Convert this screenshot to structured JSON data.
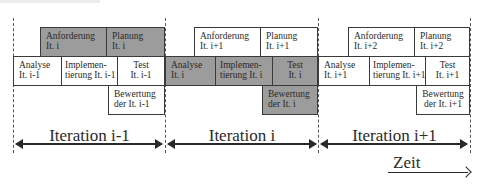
{
  "diagram": {
    "iterations": [
      {
        "label": "Iteration i-1",
        "anforderung": {
          "l1": "Anforderung",
          "l2": "It. i",
          "shaded": true
        },
        "planung": {
          "l1": "Planung",
          "l2": "It. i",
          "shaded": true
        },
        "analyse": {
          "l1": "Analyse",
          "l2": "It. i-1",
          "shaded": false
        },
        "implementierung": {
          "l1": "Implemen-",
          "l2": "tierung It. i-1",
          "shaded": false
        },
        "test": {
          "l1": "Test",
          "l2": "It. i-1",
          "shaded": false
        },
        "bewertung": {
          "l1": "Bewertung",
          "l2": "der It. i-1",
          "shaded": false
        }
      },
      {
        "label": "Iteration i",
        "anforderung": {
          "l1": "Anforderung",
          "l2": "It. i+1",
          "shaded": false
        },
        "planung": {
          "l1": "Planung",
          "l2": "It. i+1",
          "shaded": false
        },
        "analyse": {
          "l1": "Analyse",
          "l2": "It. i",
          "shaded": true
        },
        "implementierung": {
          "l1": "Implemen-",
          "l2": "tierung It. i",
          "shaded": true
        },
        "test": {
          "l1": "Test",
          "l2": "It. i",
          "shaded": true
        },
        "bewertung": {
          "l1": "Bewertung",
          "l2": "der It. i",
          "shaded": true
        }
      },
      {
        "label": "Iteration i+1",
        "anforderung": {
          "l1": "Anforderung",
          "l2": "It. i+2",
          "shaded": false
        },
        "planung": {
          "l1": "Planung",
          "l2": "It. i+2",
          "shaded": false
        },
        "analyse": {
          "l1": "Analyse",
          "l2": "It. i+1",
          "shaded": false
        },
        "implementierung": {
          "l1": "Implemen-",
          "l2": "tierung It. i+1",
          "shaded": false
        },
        "test": {
          "l1": "Test",
          "l2": "It. i+1",
          "shaded": false
        },
        "bewertung": {
          "l1": "Bewertung",
          "l2": "der It. i+1",
          "shaded": false
        }
      }
    ],
    "time_axis": {
      "label": "Zeit"
    },
    "colors": {
      "shaded": "#9c9c9c",
      "unshaded": "#ffffff",
      "line": "#2a2a2a"
    }
  }
}
